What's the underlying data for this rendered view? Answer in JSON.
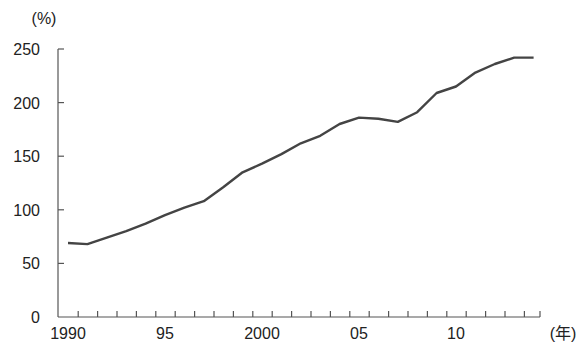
{
  "chart_data": {
    "type": "line",
    "title": "",
    "xlabel": "(年)",
    "ylabel": "(%)",
    "ylim": [
      0,
      250
    ],
    "yticks": [
      0,
      50,
      100,
      150,
      200,
      250
    ],
    "ytick_labels": [
      "0",
      "50",
      "100",
      "150",
      "200",
      "250"
    ],
    "xtick_labels": [
      {
        "year": 1990,
        "label": "1990"
      },
      {
        "year": 1995,
        "label": "95"
      },
      {
        "year": 2000,
        "label": "2000"
      },
      {
        "year": 2005,
        "label": "05"
      },
      {
        "year": 2010,
        "label": "10"
      }
    ],
    "grid": false,
    "legend": null,
    "x": [
      1990,
      1991,
      1992,
      1993,
      1994,
      1995,
      1996,
      1997,
      1998,
      1999,
      2000,
      2001,
      2002,
      2003,
      2004,
      2005,
      2006,
      2007,
      2008,
      2009,
      2010,
      2011,
      2012,
      2013,
      2014
    ],
    "series": [
      {
        "name": "value",
        "color": "#444444",
        "values": [
          69,
          68,
          74,
          80,
          87,
          95,
          102,
          108,
          121,
          135,
          143,
          152,
          162,
          169,
          180,
          186,
          185,
          182,
          191,
          209,
          215,
          228,
          236,
          242,
          242
        ]
      }
    ]
  }
}
